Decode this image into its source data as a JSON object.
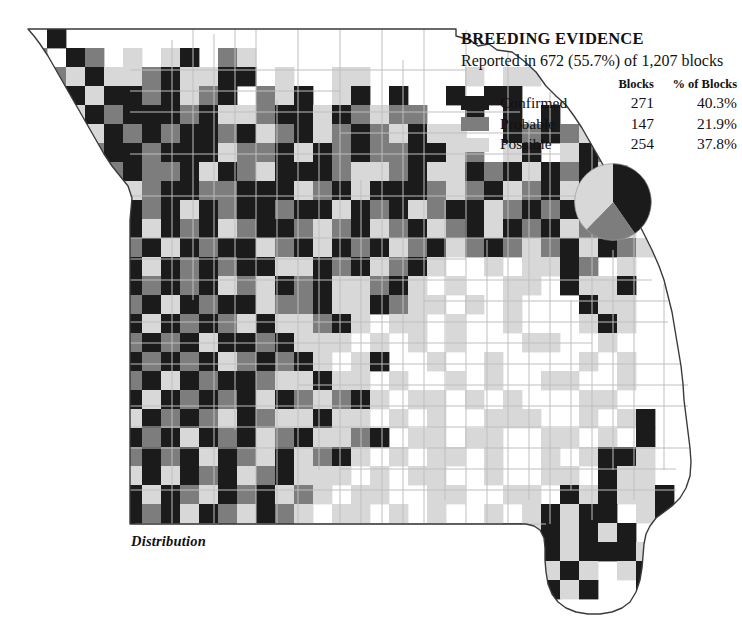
{
  "legend": {
    "title": "BREEDING EVIDENCE",
    "subtitle": "Reported in 672 (55.7%) of 1,207 blocks",
    "col_blocks": "Blocks",
    "col_pct": "% of Blocks",
    "rows": [
      {
        "label": "Confirmed",
        "blocks": "271",
        "percent": "40.3%",
        "color": "#1b1b1b",
        "swatch_name": "confirmed"
      },
      {
        "label": "Probable",
        "blocks": "147",
        "percent": "21.9%",
        "color": "#7d7d7d",
        "swatch_name": "probable"
      },
      {
        "label": "Possible",
        "blocks": "254",
        "percent": "37.8%",
        "color": "#d8d8d8",
        "swatch_name": "possible"
      }
    ]
  },
  "caption": "Distribution",
  "colors": {
    "confirmed": "#1b1b1b",
    "probable": "#7d7d7d",
    "possible": "#d8d8d8",
    "empty": "#ffffff",
    "county_line": "#bfbfbf",
    "state_line": "#3a3a3a",
    "text": "#111111",
    "background": "#ffffff"
  },
  "chart_data": {
    "type": "pie",
    "title": "BREEDING EVIDENCE",
    "subtitle": "Reported in 672 (55.7%) of 1,207 blocks",
    "legend_position": "above-right",
    "categories": [
      "Confirmed",
      "Probable",
      "Possible"
    ],
    "values": [
      271,
      147,
      254
    ],
    "percentages": [
      40.3,
      21.9,
      37.8
    ],
    "colors": [
      "#1b1b1b",
      "#7d7d7d",
      "#d8d8d8"
    ],
    "total_reported_blocks": 672,
    "total_blocks": 1207,
    "reported_percent": 55.7,
    "start_angle_deg": 0,
    "direction": "clockwise",
    "center": [
      613,
      202
    ],
    "radius": 39
  },
  "map": {
    "name": "missouri-breeding-block-map",
    "grid": {
      "origin_x": 28,
      "origin_y": 29,
      "cell_w": 19.0,
      "cell_h": 19.0,
      "cols": 34,
      "rows": 30,
      "legend_order": [
        "empty",
        "confirmed",
        "probable",
        "possible"
      ]
    },
    "cells": [
      "0100000000000000000000000000000000",
      "2012030310230000000000000000000000",
      "0231332133110300330000030330000000",
      "3213112132102310310100101100333000",
      "0331211121332113123220010101032100",
      "0033121211213213212313300121230210",
      "0312112111322131212211320310312130",
      "0331212213123111233213312131213310",
      "0032132112211132131112321321312201",
      "0013112131211211312132113212130310",
      "0001213121321123213213213121321300",
      "0001121312113213121321321232131230",
      "0011213121211331213213003033120300",
      "0001312121323121332130300330133100",
      "0001121312113221331233030300013300",
      "0001213121231332130330300300031300",
      "0001121213112133303030300033003000",
      "0001312121321213031003003000030300",
      "0001121312112331330300303003300300",
      "0011213121213123213033030300033000",
      "0012131212312331330303003330030310",
      "0001312131213213321033033003303010",
      "0013121213123132130303303003031130",
      "0001231312132133303033003003301330",
      "0031213123121323033003300330131331",
      "0012312131231230330303003031311031",
      "0031213132132103003030330131313103",
      "0001231231213030330300330131311130",
      "0000132123130303030300301313130310",
      "0000012031003003030030013131310010"
    ]
  }
}
